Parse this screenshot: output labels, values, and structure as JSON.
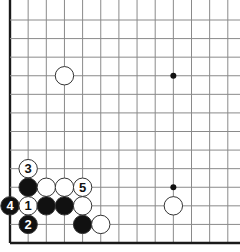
{
  "board": {
    "description": "Go diagram: lower-left corner position with numbered moves",
    "colors": {
      "background": "#ffffff",
      "grid_line": "#8a8a8a",
      "edge_line": "#1a1a1a",
      "black_stone": "#111111",
      "white_stone": "#ffffff",
      "stone_outline": "#333333",
      "black_label": "#ffffff",
      "white_label": "#111111"
    },
    "grid": {
      "x_origin": 10,
      "x_step": 18.15,
      "columns": 13,
      "y_top": 20,
      "y_bottom": 243,
      "rows": 13
    },
    "star_points": [
      {
        "col": 9,
        "row": 3
      },
      {
        "col": 9,
        "row": 9
      }
    ],
    "stones": [
      {
        "color": "white",
        "col": 3,
        "row": 3,
        "label": ""
      },
      {
        "color": "white",
        "col": 9,
        "row": 10,
        "label": ""
      },
      {
        "color": "white",
        "col": 1,
        "row": 8,
        "label": "3"
      },
      {
        "color": "black",
        "col": 1,
        "row": 9,
        "label": ""
      },
      {
        "color": "white",
        "col": 2,
        "row": 9,
        "label": ""
      },
      {
        "color": "white",
        "col": 3,
        "row": 9,
        "label": ""
      },
      {
        "color": "white",
        "col": 4,
        "row": 9,
        "label": "5"
      },
      {
        "color": "black",
        "col": 0,
        "row": 10,
        "label": "4"
      },
      {
        "color": "white",
        "col": 1,
        "row": 10,
        "label": "1"
      },
      {
        "color": "black",
        "col": 2,
        "row": 10,
        "label": ""
      },
      {
        "color": "black",
        "col": 3,
        "row": 10,
        "label": ""
      },
      {
        "color": "white",
        "col": 4,
        "row": 10,
        "label": ""
      },
      {
        "color": "black",
        "col": 1,
        "row": 11,
        "label": "2"
      },
      {
        "color": "black",
        "col": 4,
        "row": 11,
        "label": ""
      },
      {
        "color": "white",
        "col": 5,
        "row": 11,
        "label": ""
      }
    ]
  }
}
